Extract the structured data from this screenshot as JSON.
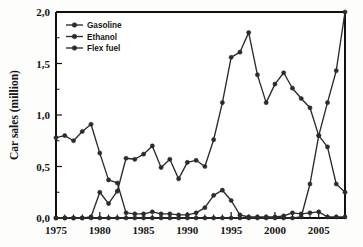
{
  "chart_data": {
    "type": "line",
    "title": "",
    "xlabel": "",
    "ylabel": "Car sales (million)",
    "xlim": [
      1975,
      2008
    ],
    "ylim": [
      0,
      2.0
    ],
    "grid": false,
    "legend_position": "top-left",
    "x_tick_labels": [
      "1975",
      "1980",
      "1985",
      "1990",
      "1995",
      "2000",
      "2005"
    ],
    "x_ticks": [
      1975,
      1980,
      1985,
      1990,
      1995,
      2000,
      2005
    ],
    "y_tick_labels": [
      "0,0",
      "0,5",
      "1,0",
      "1,5",
      "2,0"
    ],
    "y_ticks": [
      0.0,
      0.5,
      1.0,
      1.5,
      2.0
    ],
    "x": [
      1975,
      1976,
      1977,
      1978,
      1979,
      1980,
      1981,
      1982,
      1983,
      1984,
      1985,
      1986,
      1987,
      1988,
      1989,
      1990,
      1991,
      1992,
      1993,
      1994,
      1995,
      1996,
      1997,
      1998,
      1999,
      2000,
      2001,
      2002,
      2003,
      2004,
      2005,
      2006,
      2007,
      2008
    ],
    "series": [
      {
        "name": "Gasoline",
        "values": [
          0.78,
          0.8,
          0.75,
          0.84,
          0.91,
          0.63,
          0.37,
          0.34,
          0.05,
          0.04,
          0.04,
          0.06,
          0.04,
          0.04,
          0.03,
          0.03,
          0.05,
          0.1,
          0.22,
          0.27,
          0.17,
          0.03,
          0.01,
          0.01,
          0.01,
          0.01,
          0.02,
          0.05,
          0.04,
          0.05,
          0.06,
          0.01,
          0.01,
          0.01
        ]
      },
      {
        "name": "Ethanol",
        "values": [
          0.0,
          0.0,
          0.0,
          0.0,
          0.01,
          0.25,
          0.14,
          0.26,
          0.58,
          0.57,
          0.62,
          0.7,
          0.49,
          0.57,
          0.38,
          0.54,
          0.56,
          0.5,
          0.76,
          1.12,
          1.56,
          1.61,
          1.8,
          1.39,
          1.12,
          1.3,
          1.41,
          1.26,
          1.16,
          1.07,
          0.8,
          0.69,
          0.33,
          0.25
        ]
      },
      {
        "name": "Flex fuel",
        "values": [
          0.0,
          0.0,
          0.0,
          0.0,
          0.0,
          0.0,
          0.0,
          0.0,
          0.0,
          0.0,
          0.0,
          0.0,
          0.0,
          0.0,
          0.0,
          0.0,
          0.0,
          0.0,
          0.0,
          0.0,
          0.0,
          0.0,
          0.0,
          0.0,
          0.0,
          0.0,
          0.0,
          0.0,
          0.01,
          0.33,
          0.8,
          1.12,
          1.43,
          2.0
        ]
      }
    ]
  },
  "legend": {
    "items": [
      {
        "label": "Gasoline"
      },
      {
        "label": "Ethanol"
      },
      {
        "label": "Flex fuel"
      }
    ]
  }
}
